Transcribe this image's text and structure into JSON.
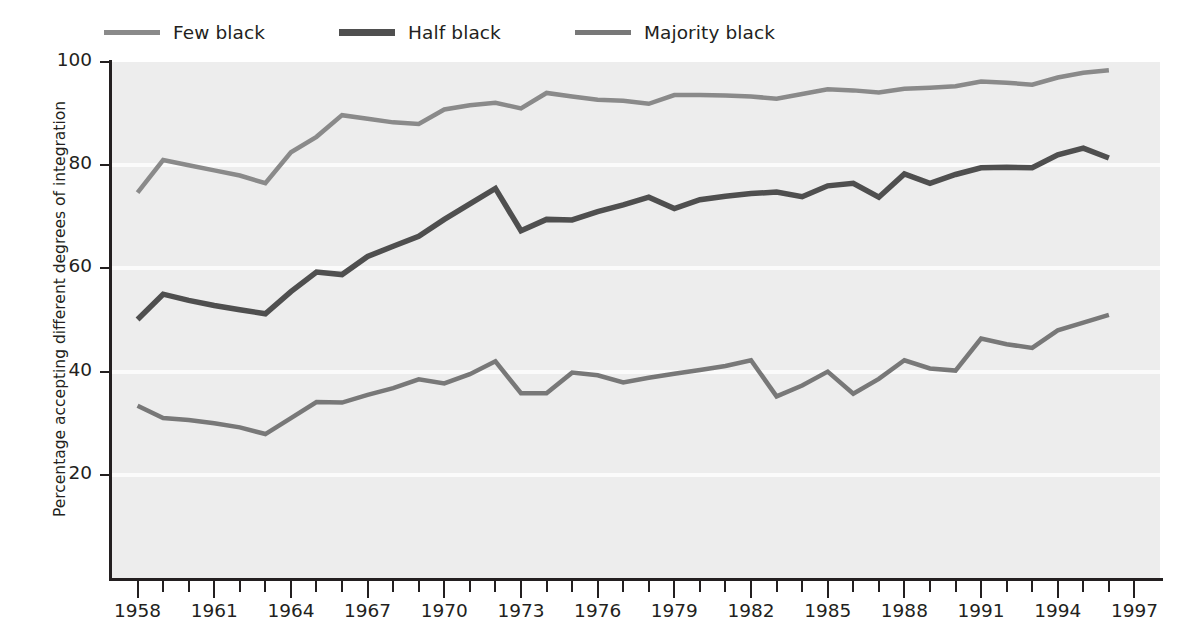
{
  "chart_data": {
    "type": "line",
    "title": "",
    "xlabel": "",
    "ylabel": "Percentage accepting different degrees of integration",
    "xlim": [
      1957.0,
      1998.0
    ],
    "ylim": [
      0,
      100
    ],
    "grid": "horizontal white gridlines at 20, 40, 60, 80",
    "legend_position": "top-left, above plot",
    "xticks_major": [
      1958,
      1961,
      1964,
      1967,
      1970,
      1973,
      1976,
      1979,
      1982,
      1985,
      1988,
      1991,
      1994,
      1997
    ],
    "xticks_minor_every": 1,
    "yticks": [
      20,
      40,
      60,
      80,
      100
    ],
    "x": [
      1958,
      1959,
      1960,
      1961,
      1962,
      1963,
      1964,
      1965,
      1966,
      1967,
      1968,
      1969,
      1970,
      1971,
      1972,
      1973,
      1974,
      1975,
      1976,
      1977,
      1978,
      1979,
      1980,
      1981,
      1982,
      1983,
      1984,
      1985,
      1986,
      1987,
      1988,
      1989,
      1990,
      1991,
      1992,
      1993,
      1994,
      1995,
      1996
    ],
    "series": [
      {
        "name": "Few black",
        "color": "#8a8a8a",
        "width": 4.5,
        "values": [
          74.7,
          81.0,
          80.0,
          79.0,
          78.0,
          76.5,
          82.5,
          85.5,
          89.7,
          89.0,
          88.3,
          88.0,
          90.8,
          91.6,
          92.1,
          91.0,
          94.0,
          93.3,
          92.7,
          92.5,
          91.9,
          93.6,
          93.6,
          93.5,
          93.3,
          92.9,
          93.8,
          94.7,
          94.5,
          94.1,
          94.8,
          95.0,
          95.3,
          96.2,
          96.0,
          95.6,
          97.0,
          97.9,
          98.4
        ]
      },
      {
        "name": "Half black",
        "color": "#4f4f4f",
        "width": 5.5,
        "values": [
          50.1,
          55.0,
          53.8,
          52.8,
          52.0,
          51.2,
          55.5,
          59.3,
          58.8,
          62.3,
          64.3,
          66.2,
          69.5,
          72.5,
          75.5,
          67.3,
          69.5,
          69.4,
          71.0,
          72.3,
          73.8,
          71.6,
          73.3,
          74.0,
          74.5,
          74.8,
          73.9,
          76.0,
          76.5,
          73.8,
          78.3,
          76.5,
          78.2,
          79.5,
          79.6,
          79.5,
          82.0,
          83.3,
          81.4
        ]
      },
      {
        "name": "Majority black",
        "color": "#787878",
        "width": 4.5,
        "values": [
          33.4,
          31.0,
          30.6,
          30.0,
          29.2,
          27.9,
          31.0,
          34.1,
          34.0,
          35.5,
          36.8,
          38.5,
          37.7,
          39.5,
          42.0,
          35.8,
          35.8,
          39.8,
          39.3,
          37.9,
          38.8,
          39.6,
          40.3,
          41.1,
          42.2,
          35.2,
          37.3,
          40.0,
          35.7,
          38.6,
          42.2,
          40.6,
          40.2,
          46.4,
          45.3,
          44.6,
          48.0,
          49.5,
          51.0
        ]
      }
    ]
  },
  "legend": {
    "items": [
      {
        "label": "Few black"
      },
      {
        "label": "Half black"
      },
      {
        "label": "Majority black"
      }
    ]
  },
  "axes": {
    "y_title": "Percentage accepting different degrees of integration",
    "y_tick_labels": [
      "20",
      "40",
      "60",
      "80",
      "100"
    ],
    "x_tick_labels": [
      "1958",
      "1961",
      "1964",
      "1967",
      "1970",
      "1973",
      "1976",
      "1979",
      "1982",
      "1985",
      "1988",
      "1991",
      "1994",
      "1997"
    ]
  },
  "colors": {
    "plot_background": "#ededed",
    "gridline": "#fbfbfb",
    "axis": "#231f20",
    "page_background": "#ffffff"
  }
}
